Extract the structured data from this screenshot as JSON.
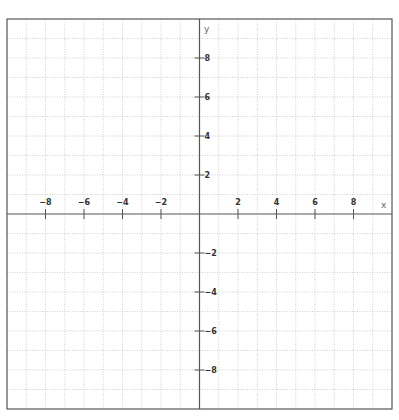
{
  "chart_data": {
    "type": "scatter",
    "title": "",
    "xlabel": "x",
    "ylabel": "y",
    "xlim": [
      -10,
      10
    ],
    "ylim": [
      -10,
      10
    ],
    "grid": true,
    "grid_step": 1,
    "grid_style": "dotted",
    "x_ticks": [
      -8,
      -6,
      -4,
      -2,
      2,
      4,
      6,
      8
    ],
    "y_ticks": [
      -8,
      -6,
      -4,
      -2,
      2,
      4,
      6,
      8
    ],
    "series": []
  },
  "colors": {
    "frame": "#555555",
    "axis": "#555555",
    "grid": "#bbbbbb",
    "tick_text": "#333333",
    "axis_label": "#666666"
  }
}
